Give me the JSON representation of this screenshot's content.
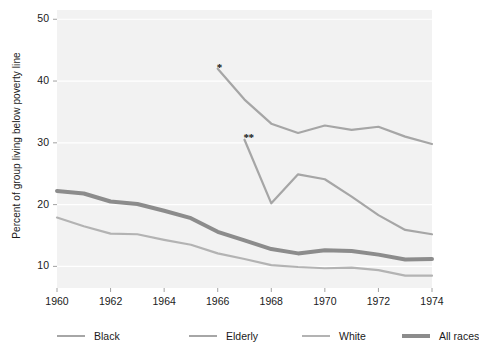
{
  "chart_data": {
    "type": "line",
    "title": "",
    "xlabel": "",
    "ylabel": "Percent of group living below poverty line",
    "xlim": [
      1960,
      1974
    ],
    "ylim": [
      6.5,
      51.5
    ],
    "grid": true,
    "legend_position": "bottom",
    "xticks": [
      1960,
      1962,
      1964,
      1966,
      1968,
      1970,
      1972,
      1974
    ],
    "yticks": [
      10,
      20,
      30,
      40,
      50
    ],
    "annotations": [
      {
        "text": "*",
        "x": 1966,
        "y": 42.6
      },
      {
        "text": "**",
        "x": 1967,
        "y": 31.2
      }
    ],
    "series": [
      {
        "name": "Black",
        "color": "#a6a6a6",
        "width": 2.2,
        "x": [
          1966,
          1967,
          1968,
          1969,
          1970,
          1971,
          1972,
          1973,
          1974
        ],
        "values": [
          42.0,
          37.0,
          33.1,
          31.6,
          32.8,
          32.1,
          32.6,
          31.0,
          29.8
        ]
      },
      {
        "name": "Elderly",
        "color": "#a6a6a6",
        "width": 2.2,
        "x": [
          1967,
          1968,
          1969,
          1970,
          1971,
          1972,
          1973,
          1974
        ],
        "values": [
          30.5,
          20.2,
          24.9,
          24.1,
          21.3,
          18.3,
          15.9,
          15.2
        ]
      },
      {
        "name": "White",
        "color": "#b3b3b3",
        "width": 2.2,
        "x": [
          1960,
          1961,
          1962,
          1963,
          1964,
          1965,
          1966,
          1967,
          1968,
          1969,
          1970,
          1971,
          1972,
          1973,
          1974
        ],
        "values": [
          17.9,
          16.5,
          15.3,
          15.2,
          14.3,
          13.5,
          12.1,
          11.2,
          10.2,
          9.9,
          9.7,
          9.8,
          9.4,
          8.5,
          8.5
        ]
      },
      {
        "name": "All races",
        "color": "#8c8c8c",
        "width": 4.0,
        "x": [
          1960,
          1961,
          1962,
          1963,
          1964,
          1965,
          1966,
          1967,
          1968,
          1969,
          1970,
          1971,
          1972,
          1973,
          1974
        ],
        "values": [
          22.2,
          21.8,
          20.5,
          20.1,
          19.0,
          17.8,
          15.6,
          14.2,
          12.8,
          12.1,
          12.6,
          12.5,
          11.9,
          11.1,
          11.2
        ]
      }
    ]
  },
  "axes": {
    "ylabel": "Percent of group living below poverty line",
    "ytick_labels": [
      "50",
      "40",
      "30",
      "20",
      "10"
    ],
    "xtick_labels": [
      "1960",
      "1962",
      "1964",
      "1966",
      "1968",
      "1970",
      "1972",
      "1974"
    ]
  },
  "legend": {
    "items": [
      {
        "label": "Black"
      },
      {
        "label": "Elderly"
      },
      {
        "label": "White"
      },
      {
        "label": "All races"
      }
    ]
  },
  "annotations": {
    "single_asterisk": "*",
    "double_asterisk": "**"
  },
  "colors": {
    "plot_background": "#f2f2f2",
    "gridline": "#ffffff",
    "text": "#1a1a1a",
    "black_series": "#a6a6a6",
    "elderly_series": "#a6a6a6",
    "white_series": "#b3b3b3",
    "all_races_series": "#8c8c8c"
  }
}
